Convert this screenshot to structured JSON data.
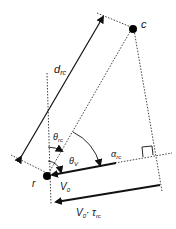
{
  "diagram": {
    "points": {
      "r": {
        "label": "r",
        "x": 47,
        "y": 176
      },
      "c": {
        "label": "c",
        "x": 133,
        "y": 28
      }
    },
    "labels": {
      "distance": {
        "main": "d",
        "sub": "rc"
      },
      "theta_rc": {
        "main": "θ",
        "sub": "rc"
      },
      "theta_v": {
        "main": "θ",
        "sub": "V"
      },
      "alpha_rc": {
        "main": "α",
        "sub": "rc"
      },
      "velocity": {
        "main": "V",
        "sub": "0"
      },
      "displacement": {
        "main": "V",
        "sub": "0",
        "mid": "· τ",
        "sub2": "rc"
      }
    },
    "colors": {
      "line": "#111111",
      "dot": "#000000"
    }
  }
}
